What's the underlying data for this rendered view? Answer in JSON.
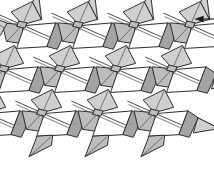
{
  "figure": {
    "background_color": "#ffffff",
    "canvas": {
      "width": 214,
      "height": 182
    }
  },
  "palette": {
    "paper_white": "#ffffff",
    "shade_light": "#cfcfcf",
    "shade_mid": "#bdbdbd",
    "shade_dark": "#a3a3a3",
    "edge_stroke": "#3a3a3a",
    "outline_stroke": "#2e2e2e",
    "crease_stroke": "#4a4a4a",
    "annotation_color": "#1a1a1a"
  },
  "lattice": {
    "columns": 4,
    "rows": 3,
    "cell_width": 56,
    "cell_height": 44,
    "row_shear_x": -18,
    "origin_x": 8,
    "origin_y": 22,
    "module_name": "waterbomb-kite-module"
  },
  "annotation": {
    "arrow": {
      "label": "",
      "direction": "left",
      "x1": 214,
      "y1": 19,
      "x2": 196,
      "y2": 19,
      "head_length": 7,
      "head_width": 5
    }
  }
}
